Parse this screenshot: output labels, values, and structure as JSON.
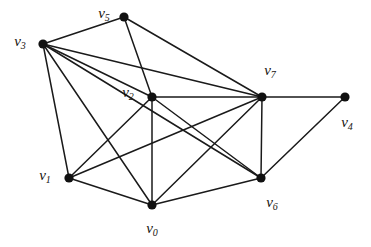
{
  "figure": {
    "kind": "undirected-graph-diagram",
    "width": 371,
    "height": 247,
    "background_color": "#ffffff",
    "edge_color": "#1a1a1a",
    "vertex_color": "#111111",
    "label_color": "#16130f"
  },
  "graph_data": {
    "type": "graph",
    "directed": false,
    "vertex_count": 8,
    "edge_count": 18,
    "vertices": [
      {
        "id": "v0",
        "name": "v",
        "subscript": "0",
        "x": 152,
        "y": 205,
        "label_x": 152,
        "label_y": 228,
        "degree": 5
      },
      {
        "id": "v1",
        "name": "v",
        "subscript": "1",
        "x": 69,
        "y": 178,
        "label_x": 45,
        "label_y": 175,
        "degree": 4
      },
      {
        "id": "v2",
        "name": "v",
        "subscript": "2",
        "x": 152,
        "y": 97,
        "label_x": 128,
        "label_y": 92,
        "degree": 7
      },
      {
        "id": "v3",
        "name": "v",
        "subscript": "3",
        "x": 43,
        "y": 44,
        "label_x": 20,
        "label_y": 41,
        "degree": 6
      },
      {
        "id": "v4",
        "name": "v",
        "subscript": "4",
        "x": 345,
        "y": 97,
        "label_x": 347,
        "label_y": 122,
        "degree": 2
      },
      {
        "id": "v5",
        "name": "v",
        "subscript": "5",
        "x": 124,
        "y": 17,
        "label_x": 104,
        "label_y": 13,
        "degree": 3
      },
      {
        "id": "v6",
        "name": "v",
        "subscript": "6",
        "x": 261,
        "y": 178,
        "label_x": 272,
        "label_y": 202,
        "degree": 4
      },
      {
        "id": "v7",
        "name": "v",
        "subscript": "7",
        "x": 262,
        "y": 97,
        "label_x": 270,
        "label_y": 70,
        "degree": 7
      }
    ],
    "edges": [
      {
        "source": "v3",
        "target": "v5"
      },
      {
        "source": "v3",
        "target": "v2"
      },
      {
        "source": "v3",
        "target": "v7"
      },
      {
        "source": "v3",
        "target": "v1"
      },
      {
        "source": "v3",
        "target": "v0"
      },
      {
        "source": "v3",
        "target": "v6"
      },
      {
        "source": "v5",
        "target": "v2"
      },
      {
        "source": "v5",
        "target": "v7"
      },
      {
        "source": "v2",
        "target": "v7"
      },
      {
        "source": "v2",
        "target": "v1"
      },
      {
        "source": "v2",
        "target": "v0"
      },
      {
        "source": "v2",
        "target": "v6"
      },
      {
        "source": "v7",
        "target": "v4"
      },
      {
        "source": "v7",
        "target": "v6"
      },
      {
        "source": "v7",
        "target": "v1"
      },
      {
        "source": "v7",
        "target": "v0"
      },
      {
        "source": "v1",
        "target": "v0"
      },
      {
        "source": "v0",
        "target": "v6"
      },
      {
        "source": "v6",
        "target": "v4"
      }
    ]
  }
}
